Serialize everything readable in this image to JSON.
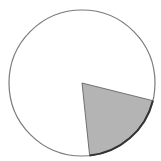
{
  "chart_data": {
    "type": "pie",
    "title": "",
    "title_note": "title text cut off at top edge; only descenders visible",
    "center": [
      82,
      83
    ],
    "radius": 73,
    "slices": [
      {
        "label": "",
        "value": 19.5,
        "start_deg": 14,
        "end_deg": 84,
        "color": "#b4b4b4",
        "highlighted": true
      },
      {
        "label": "",
        "value": 80.5,
        "start_deg": 84,
        "end_deg": 374,
        "color": "#ffffff",
        "highlighted": false
      }
    ],
    "legend": null
  },
  "colors": {
    "background": "#ffffff",
    "slice_fill": "#b4b4b4",
    "slice_edge": "#555555",
    "slice_arc": "#333333",
    "circle_outline": "#7a7a7a"
  }
}
